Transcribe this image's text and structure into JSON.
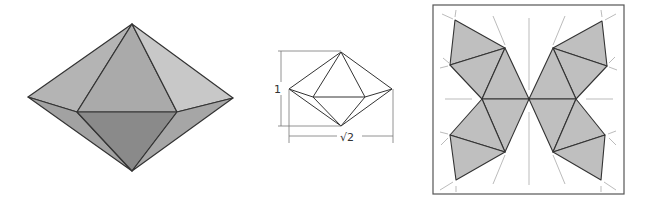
{
  "figures": {
    "solid": {
      "name": "square bipyramid (octahedron) shaded 3D view"
    },
    "dimensioned": {
      "height_label": "1",
      "width_label": "√2"
    },
    "net": {
      "name": "unfolded net of octahedron inside square frame"
    }
  },
  "colors": {
    "face_light": "#bdbdbd",
    "face_mid": "#a9a9a9",
    "face_dark": "#8c8c8c",
    "face_right_upper": "#c6c6c6",
    "edge": "#333333",
    "net_fill": "#bfbfbf",
    "guide": "#a0a0a0"
  }
}
